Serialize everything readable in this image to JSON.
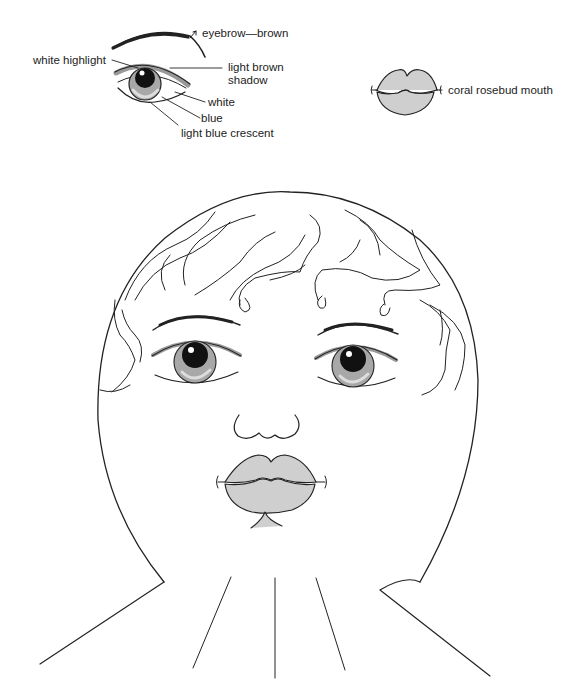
{
  "diagram": {
    "eye_detail_labels": [
      {
        "id": "eyebrow",
        "text": "eyebrow—brown"
      },
      {
        "id": "white-highlight",
        "text": "white highlight"
      },
      {
        "id": "light-brown-shadow",
        "text": "light brown shadow"
      },
      {
        "id": "white",
        "text": "white"
      },
      {
        "id": "blue",
        "text": "blue"
      },
      {
        "id": "light-blue-crescent",
        "text": "light blue crescent"
      }
    ],
    "mouth_label": "coral rosebud mouth",
    "labels": {
      "eyebrow": "eyebrow—brown",
      "white_highlight": "white highlight",
      "light_brown_line1": "light brown",
      "light_brown_line2": "shadow",
      "white": "white",
      "blue": "blue",
      "light_blue_crescent": "light blue crescent",
      "mouth": "coral rosebud mouth"
    },
    "colors": {
      "line": "#222222",
      "shadow_gray": "#9a9a9a",
      "lip_fill": "#cfcfcf",
      "pupil": "#111111"
    }
  }
}
